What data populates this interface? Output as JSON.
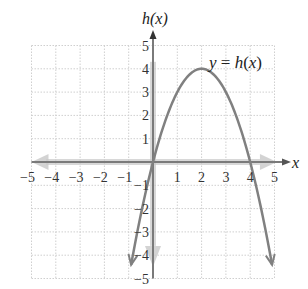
{
  "chart_data": {
    "type": "line",
    "title": "",
    "xlabel": "x",
    "ylabel": "h(x)",
    "function_label": "y = h(x)",
    "function": "h(x) = -x^2 + 4x",
    "xlim": [
      -5,
      5
    ],
    "ylim": [
      -5,
      5
    ],
    "grid": true,
    "x_ticks": [
      "-5",
      "-4",
      "-3",
      "-2",
      "-1",
      "1",
      "2",
      "3",
      "4",
      "5"
    ],
    "y_ticks": [
      "5",
      "4",
      "3",
      "2",
      "1",
      "-1",
      "-2",
      "-3",
      "-4",
      "-5"
    ],
    "series": [
      {
        "name": "y = h(x)",
        "x": [
          -0.9,
          -0.5,
          0,
          0.5,
          1,
          1.5,
          2,
          2.5,
          3,
          3.5,
          4,
          4.5,
          4.9
        ],
        "y": [
          -4.4,
          -2.25,
          0,
          1.75,
          3,
          3.75,
          4,
          3.75,
          3,
          1.75,
          0,
          -2.25,
          -4.4
        ]
      }
    ],
    "key_points": {
      "vertex": [
        2,
        4
      ],
      "x_intercepts": [
        [
          0,
          0
        ],
        [
          4,
          0
        ]
      ]
    },
    "colors": {
      "curve": "#808080",
      "axis": "#7a7a7a",
      "axis_arrow_shade": "#c8c8c8",
      "grid": "#cfcfcf"
    }
  }
}
